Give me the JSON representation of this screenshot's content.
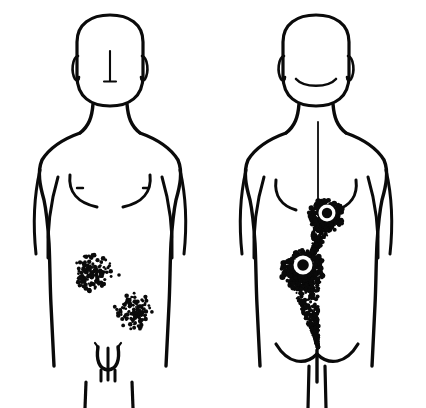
{
  "illustration": {
    "title": "Anterior and posterior human body diagram with lesion distribution",
    "background_color": "#ffffff",
    "ink_color": "#0a0a0a",
    "canvas": {
      "width": 426,
      "height": 408
    }
  },
  "figures": [
    {
      "id": "anterior",
      "label": "Anterior (front) view",
      "sex_marking": "male",
      "center_x": 112,
      "head": {
        "shape": "rounded-rect",
        "cx": 110,
        "cy": 60,
        "rx": 33,
        "ry": 45,
        "stroke_width": 3.2
      },
      "ears": [
        {
          "side": "left",
          "cx": 79,
          "cy": 66,
          "rx": 5,
          "ry": 11
        },
        {
          "side": "right",
          "cx": 141,
          "cy": 66,
          "rx": 5,
          "ry": 11
        }
      ],
      "face_features": [
        {
          "name": "nose-line",
          "x1": 110,
          "y1": 52,
          "x2": 110,
          "y2": 81
        },
        {
          "name": "nose-base",
          "x1": 104,
          "y1": 81,
          "x2": 116,
          "y2": 81
        }
      ],
      "chest_features": [
        {
          "name": "nipple-left",
          "cx": 80,
          "cy": 188,
          "w": 6
        },
        {
          "name": "nipple-right",
          "cx": 152,
          "cy": 188,
          "w": 6
        }
      ],
      "genital_outline": true,
      "stroke_width": 3.4
    },
    {
      "id": "posterior",
      "label": "Posterior (back) view",
      "sex_marking": "none",
      "center_x": 318,
      "head": {
        "shape": "rounded-rect",
        "cx": 316,
        "cy": 60,
        "rx": 33,
        "ry": 45,
        "stroke_width": 3.2
      },
      "ears": [
        {
          "side": "left",
          "cx": 285,
          "cy": 66,
          "rx": 5,
          "ry": 11
        },
        {
          "side": "right",
          "cx": 347,
          "cy": 66,
          "rx": 5,
          "ry": 11
        }
      ],
      "face_features": [
        {
          "name": "hairline-arc"
        }
      ],
      "spine_line": {
        "x": 318,
        "y1": 122,
        "y2": 215
      },
      "gluteal_fold": true,
      "stroke_width": 3.4
    }
  ],
  "lesions": [
    {
      "id": "ant-upper-left",
      "figure": "anterior",
      "type": "stipple-patch",
      "shape": "round",
      "cx": 93,
      "cy": 272,
      "rx": 19,
      "ry": 20,
      "density": 300,
      "dot_min": 1.1,
      "dot_max": 2.4,
      "has_halo": false,
      "satellite": {
        "cx": 119,
        "cy": 275,
        "r": 1.8
      }
    },
    {
      "id": "ant-lower-right",
      "figure": "anterior",
      "type": "stipple-patch",
      "shape": "round",
      "cx": 133,
      "cy": 311,
      "rx": 19,
      "ry": 19,
      "density": 265,
      "dot_min": 1.0,
      "dot_max": 2.3,
      "has_halo": false,
      "satellite": null
    },
    {
      "id": "post-upper",
      "figure": "posterior",
      "type": "comet-lesion",
      "head_cx": 326,
      "head_cy": 216,
      "head_rx": 18,
      "head_ry": 17,
      "tail_tip_x": 310,
      "tail_tip_y": 262,
      "tail_half_width": 12,
      "density": 420,
      "dot_min": 0.9,
      "dot_max": 2.2,
      "has_halo": true,
      "halo": {
        "cx": 327,
        "cy": 213,
        "outer_r": 8.5,
        "inner_r": 5.2
      }
    },
    {
      "id": "post-lower",
      "figure": "posterior",
      "type": "comet-lesion",
      "head_cx": 303,
      "head_cy": 270,
      "head_rx": 22,
      "head_ry": 20,
      "tail_tip_x": 318,
      "tail_tip_y": 348,
      "tail_half_width": 17,
      "density": 620,
      "dot_min": 0.9,
      "dot_max": 2.3,
      "has_halo": true,
      "halo": {
        "cx": 303,
        "cy": 265,
        "outer_r": 9.5,
        "inner_r": 5.8
      }
    }
  ]
}
